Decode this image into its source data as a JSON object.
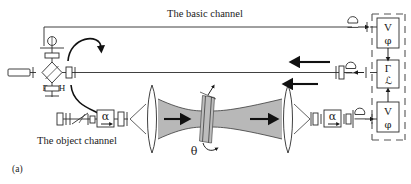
{
  "figure": {
    "panel_label": "(a)",
    "caption_basic_channel": "The basic channel",
    "caption_object_channel": "The object channel"
  },
  "beamsplitter": {
    "label_f": "F",
    "label_h": "H"
  },
  "sample": {
    "angle_label": "θ"
  },
  "modulators": {
    "object_arm_label": "α",
    "reference_arm_label": "α"
  },
  "instrument_panel": {
    "boxes": [
      {
        "name": "detector-top",
        "line1": "V",
        "line2": "φ"
      },
      {
        "name": "correlator",
        "line1": "Γ",
        "line2": "ℒ"
      },
      {
        "name": "detector-bottom",
        "line1": "V",
        "line2": "φ"
      }
    ]
  },
  "colors": {
    "ink": "#1a1a1a",
    "line": "#2b2b2b",
    "beam_fill": "#b8b8b8",
    "dashed_frame": "#555555",
    "background": "#ffffff"
  }
}
